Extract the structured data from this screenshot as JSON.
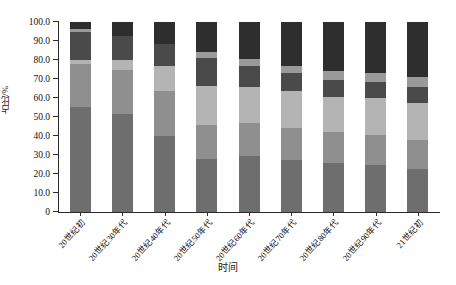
{
  "chart_data": {
    "type": "bar",
    "stacked": true,
    "title": "",
    "xlabel": "时间",
    "ylabel": "占比/%",
    "ylim": [
      0,
      100
    ],
    "yticks": [
      "0",
      "10.0",
      "20.0",
      "30.0",
      "40.0",
      "50.0",
      "60.0",
      "70.0",
      "80.0",
      "90.0",
      "100.0"
    ],
    "ytick_values": [
      0,
      10,
      20,
      30,
      40,
      50,
      60,
      70,
      80,
      90,
      100
    ],
    "grid": false,
    "legend": "none",
    "categories": [
      "20世纪初",
      "20世纪30年代",
      "20世纪40年代",
      "20世纪50年代",
      "20世纪60年代",
      "20世纪70年代",
      "20世纪80年代",
      "20世纪90年代",
      "21世纪初"
    ],
    "series": [
      {
        "name": "segment-1",
        "color": "#6e6e6e",
        "values": [
          55.5,
          51.5,
          40.0,
          28.0,
          29.5,
          27.5,
          26.0,
          25.0,
          22.5
        ]
      },
      {
        "name": "segment-2",
        "color": "#8f8f8f",
        "values": [
          22.5,
          23.5,
          23.5,
          18.0,
          17.5,
          16.5,
          16.0,
          15.5,
          15.5
        ]
      },
      {
        "name": "segment-3",
        "color": "#b4b4b4",
        "values": [
          2.0,
          5.0,
          13.5,
          20.5,
          19.0,
          19.5,
          18.5,
          19.5,
          19.5
        ]
      },
      {
        "name": "segment-4",
        "color": "#4a4a4a",
        "values": [
          15.0,
          12.5,
          11.5,
          14.5,
          11.0,
          9.5,
          9.0,
          8.5,
          8.5
        ]
      },
      {
        "name": "segment-5",
        "color": "#9a9a9a",
        "values": [
          1.5,
          0.0,
          0.0,
          3.0,
          3.5,
          4.0,
          4.5,
          4.5,
          5.0
        ]
      },
      {
        "name": "segment-6",
        "color": "#2e2e2e",
        "values": [
          3.5,
          7.5,
          11.5,
          16.0,
          19.5,
          23.0,
          26.0,
          27.0,
          29.0
        ]
      }
    ]
  },
  "axes": {
    "y_title": "占比/%",
    "x_title": "时间"
  }
}
